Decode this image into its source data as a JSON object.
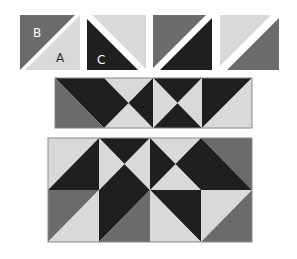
{
  "colors": {
    "A": "#d9d9d9",
    "B": "#6b6b6b",
    "C": "#1f1f1f",
    "gap": "#ffffff",
    "outline": "#8a8a8a"
  },
  "fabric_key": {
    "labels": {
      "B": "B",
      "A": "A",
      "C": "C"
    },
    "units": [
      {
        "name": "hst-BA",
        "diagonal": "bl-tr",
        "first": "B",
        "second": "A",
        "labels": [
          "B",
          "A"
        ]
      },
      {
        "name": "hst-AC",
        "diagonal": "tl-br",
        "first": "A",
        "second": "C",
        "labels": [
          "",
          "C"
        ]
      },
      {
        "name": "hst-BC",
        "diagonal": "bl-tr",
        "first": "B",
        "second": "C",
        "labels": [
          "",
          ""
        ]
      },
      {
        "name": "hst-AB",
        "diagonal": "bl-tr",
        "first": "A",
        "second": "B",
        "labels": [
          "",
          ""
        ]
      }
    ]
  },
  "middle_row": {
    "blocks": [
      {
        "type": "hst",
        "diagonal": "tl-br",
        "upper_right": "C",
        "lower_left": "B"
      },
      {
        "type": "hourglass",
        "top": "A",
        "bottom": "A",
        "left": "C",
        "right": "C"
      },
      {
        "type": "hourglass",
        "top": "C",
        "bottom": "C",
        "left": "A",
        "right": "A"
      },
      {
        "type": "hst",
        "diagonal": "bl-tr",
        "upper_left": "C",
        "lower_right": "A"
      }
    ]
  },
  "bottom_grid": {
    "rows": [
      [
        {
          "type": "hst",
          "diagonal": "bl-tr",
          "upper_left": "A",
          "lower_right": "C"
        },
        {
          "type": "hourglass",
          "top": "C",
          "bottom": "C",
          "left": "A",
          "right": "A"
        },
        {
          "type": "hourglass",
          "top": "A",
          "bottom": "A",
          "left": "C",
          "right": "C"
        },
        {
          "type": "hst",
          "diagonal": "tl-br",
          "upper_right": "B",
          "lower_left": "C"
        }
      ],
      [
        {
          "type": "hst",
          "diagonal": "bl-tr",
          "upper_left": "B",
          "lower_right": "A"
        },
        {
          "type": "hst",
          "diagonal": "bl-tr",
          "upper_left": "C",
          "lower_right": "B"
        },
        {
          "type": "hst",
          "diagonal": "tl-br",
          "upper_right": "C",
          "lower_left": "A"
        },
        {
          "type": "hst",
          "diagonal": "bl-tr",
          "upper_left": "A",
          "lower_right": "B"
        }
      ]
    ]
  }
}
